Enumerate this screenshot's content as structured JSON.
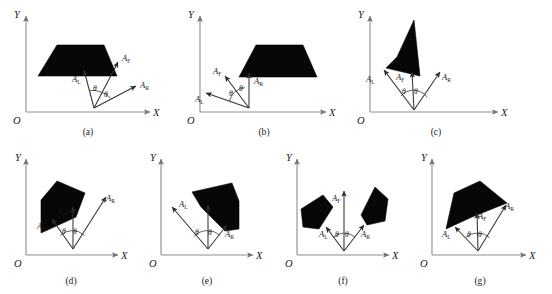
{
  "figure": {
    "axis_labels": {
      "x": "X",
      "y": "Y",
      "origin": "O"
    },
    "vector_labels": {
      "left": {
        "base": "A",
        "sub": "L"
      },
      "front": {
        "base": "A",
        "sub": "F"
      },
      "right": {
        "base": "A",
        "sub": "R"
      }
    },
    "angle_label": "θ",
    "colors": {
      "shape_fill": "#070707",
      "axis": "#8d8d8d",
      "vector": "#333333",
      "text": "#1a1a1a",
      "background": "#ffffff"
    },
    "panels": [
      {
        "id": "a",
        "caption": "(a)",
        "angles": [
          "θ",
          "θ"
        ],
        "vectors": [
          "A_L",
          "A_F",
          "A_R"
        ]
      },
      {
        "id": "b",
        "caption": "(b)",
        "angles": [
          "θ",
          "θ"
        ],
        "vectors": [
          "A_L",
          "A_F",
          "A_R"
        ]
      },
      {
        "id": "c",
        "caption": "(c)",
        "angles": [
          "θ",
          "θ"
        ],
        "vectors": [
          "A_L",
          "A_F",
          "A_R"
        ]
      },
      {
        "id": "d",
        "caption": "(d)",
        "angles": [
          "θ",
          "θ"
        ],
        "vectors": [
          "A_L",
          "A_F",
          "A_R"
        ]
      },
      {
        "id": "e",
        "caption": "(e)",
        "angles": [
          "θ",
          "θ"
        ],
        "vectors": [
          "A_L",
          "A_F",
          "A_R"
        ]
      },
      {
        "id": "f",
        "caption": "(f)",
        "angles": [
          "θ",
          "θ"
        ],
        "vectors": [
          "A_L",
          "A_F",
          "A_R"
        ]
      },
      {
        "id": "g",
        "caption": "(g)",
        "angles": [
          "θ",
          "θ"
        ],
        "vectors": [
          "A_L",
          "A_F",
          "A_R"
        ]
      }
    ]
  }
}
